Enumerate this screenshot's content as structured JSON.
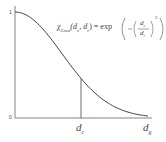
{
  "chart_data": {
    "type": "line",
    "title": "",
    "xlabel": "",
    "ylabel": "",
    "y_ticks": [
      "0",
      "1"
    ],
    "x_ticks": [
      "d_c",
      "d_g"
    ],
    "ylim": [
      0,
      1
    ],
    "xlim_ratio_dc_over_dg": 0.5,
    "annotation": "χ_Gmod(d_c, d_r) = exp(-(d_c/d_r)^2)",
    "series": [
      {
        "name": "exp(-(d/d_c)^2)",
        "x": [
          0,
          0.25,
          0.5,
          0.75,
          1.0,
          1.25,
          1.5,
          1.75,
          2.0
        ],
        "values": [
          1.0,
          0.94,
          0.78,
          0.57,
          0.37,
          0.21,
          0.105,
          0.047,
          0.018
        ]
      }
    ],
    "marker_line": {
      "x": "d_c",
      "y_value": 0.37
    },
    "grid": false,
    "legend": "none"
  },
  "labels": {
    "y_top": "1",
    "y_bottom": "0",
    "x_dc_main": "d",
    "x_dc_sub": "c",
    "x_dg_main": "d",
    "x_dg_sub": "g",
    "formula_chi": "χ",
    "formula_sub": "Gmod",
    "formula_args": "(d",
    "formula_arg1_sub": "c",
    "formula_mid": ", d",
    "formula_arg2_sub": "r",
    "formula_eq": ") = exp",
    "formula_frac_num": "d",
    "formula_frac_num_sub": "c",
    "formula_frac_den": "d",
    "formula_frac_den_sub": "r",
    "formula_exp": "2"
  }
}
